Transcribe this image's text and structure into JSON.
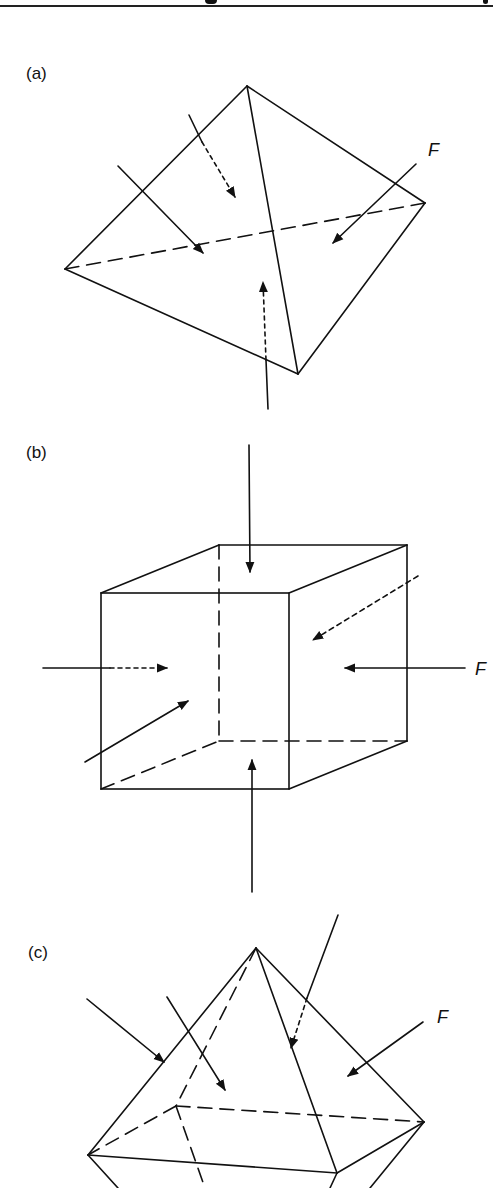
{
  "figure": {
    "header_rule": true,
    "panels": [
      {
        "id": "a",
        "label": "(a)",
        "shape": "tetrahedron",
        "force_label": "F"
      },
      {
        "id": "b",
        "label": "(b)",
        "shape": "cube",
        "force_label": "F"
      },
      {
        "id": "c",
        "label": "(c)",
        "shape": "octahedron",
        "force_label": "F"
      }
    ]
  }
}
